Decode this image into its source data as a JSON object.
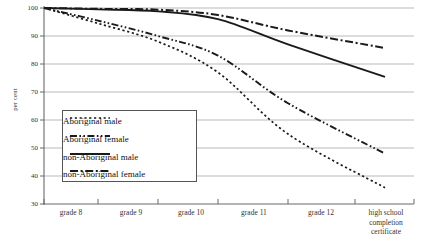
{
  "chart_data": {
    "type": "line",
    "title": "",
    "xlabel": "",
    "ylabel": "per cent",
    "ylim": [
      30,
      100
    ],
    "yticks": [
      30,
      40,
      50,
      60,
      70,
      80,
      90,
      100
    ],
    "grid": true,
    "legend_position": "center-left-inside",
    "categories": [
      "grade 8",
      "grade 9",
      "grade 10",
      "grade 11",
      "grade 12",
      "high school completion certificate"
    ],
    "series": [
      {
        "name": "Aboriginal male",
        "style": "dotted",
        "values": [
          100,
          94.5,
          88,
          77,
          55,
          35.8
        ]
      },
      {
        "name": "Aboriginal female",
        "style": "dash-dot-dot",
        "values": [
          100,
          95.5,
          90,
          83,
          66,
          48
        ]
      },
      {
        "name": "non-Aboriginal male",
        "style": "solid",
        "values": [
          100,
          99.5,
          98.8,
          96,
          87,
          75.4
        ]
      },
      {
        "name": "non-Aboriginal female",
        "style": "dash-dot",
        "values": [
          100,
          99.7,
          99.4,
          97.5,
          92,
          85.7
        ]
      }
    ]
  },
  "axis": {
    "y_label": "per cent",
    "y_tick_labels": [
      "100",
      "90",
      "80",
      "70",
      "60",
      "50",
      "40",
      "30"
    ],
    "x_tick_labels": [
      "grade 8",
      "grade 9",
      "grade 10",
      "grade 11",
      "grade 12",
      "high school\ncompletion\ncertificate"
    ]
  },
  "legend": {
    "items": [
      {
        "label": "Aboriginal male"
      },
      {
        "label": "Aboriginal female"
      },
      {
        "label": "non-Aboriginal male"
      },
      {
        "label": "non-Aboriginal female"
      }
    ]
  },
  "colors": {
    "line": "#1a1a1a",
    "grid": "#b9b9b9",
    "axis": "#6b6b6b",
    "text": "#333333"
  }
}
